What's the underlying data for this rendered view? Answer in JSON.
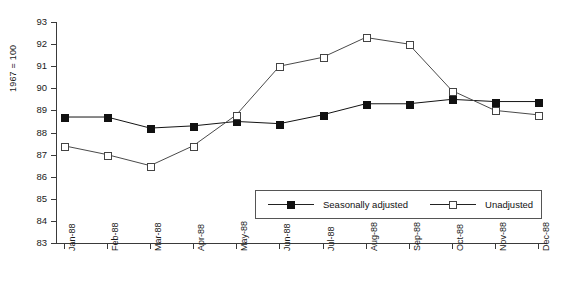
{
  "chart_data": {
    "type": "line",
    "title": "",
    "xlabel": "",
    "ylabel": "1967 = 100",
    "ylim": [
      83,
      93
    ],
    "ytick_labels": [
      "93",
      "92",
      "91",
      "90",
      "89",
      "88",
      "87",
      "86",
      "85",
      "84",
      "83"
    ],
    "ytick_values": [
      93,
      92,
      91,
      90,
      89,
      88,
      87,
      86,
      85,
      84,
      83
    ],
    "grid": false,
    "legend_position": "inside-bottom-right",
    "categories": [
      "Jan-88",
      "Feb-88",
      "Mar-88",
      "Apr-88",
      "May-88",
      "Jun-88",
      "Jul-88",
      "Aug-88",
      "Sep-88",
      "Oct-88",
      "Nov-88",
      "Dec-88"
    ],
    "series": [
      {
        "name": "Seasonally adjusted",
        "marker": "filled-square",
        "color": "#111111",
        "values": [
          88.7,
          88.7,
          88.2,
          88.3,
          88.5,
          88.4,
          88.8,
          89.3,
          89.3,
          89.5,
          89.4,
          89.4
        ]
      },
      {
        "name": "Unadjusted",
        "marker": "open-square",
        "color": "#ffffff",
        "values": [
          87.4,
          87.0,
          86.5,
          87.4,
          88.8,
          91.0,
          91.4,
          92.3,
          92.0,
          89.9,
          89.0,
          88.8
        ]
      }
    ]
  },
  "legend": {
    "entries": [
      {
        "label": "Seasonally adjusted"
      },
      {
        "label": "Unadjusted"
      }
    ]
  },
  "axis": {
    "y_title": "1967 = 100"
  }
}
